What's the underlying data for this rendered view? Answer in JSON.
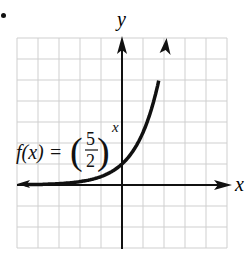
{
  "chart_data": {
    "type": "line",
    "title": "",
    "function_label": "f(x) = (5/2)^x",
    "label_parts": {
      "lhs": "f(x) =",
      "num": "5",
      "den": "2",
      "exp": "x"
    },
    "xlabel": "x",
    "ylabel": "y",
    "xlim": [
      -5,
      5
    ],
    "ylim": [
      -3,
      7
    ],
    "grid": true,
    "series": [
      {
        "name": "f(x) = (5/2)^x",
        "x": [
          -5,
          -4,
          -3,
          -2,
          -1,
          0,
          1,
          2,
          2.12
        ],
        "y": [
          0.01,
          0.03,
          0.06,
          0.16,
          0.4,
          1,
          2.5,
          6.25,
          7
        ]
      }
    ]
  },
  "colors": {
    "grid": "#c8c8c8",
    "axis": "#111111",
    "curve": "#111111"
  }
}
